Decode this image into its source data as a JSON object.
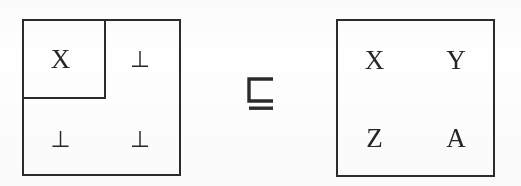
{
  "figure": {
    "kind": "matrix-refinement-diagram",
    "ink_color": "#2b2b2b",
    "background_color": "#fefefe"
  },
  "left_matrix": {
    "name": "partial-matrix",
    "rows": 2,
    "columns": 2,
    "cells": [
      [
        {
          "text": "X",
          "kind": "variable"
        },
        {
          "text": "⊥",
          "kind": "bottom"
        }
      ],
      [
        {
          "text": "⊥",
          "kind": "bottom"
        },
        {
          "text": "⊥",
          "kind": "bottom"
        }
      ]
    ],
    "inner_box": {
      "name": "defined-region",
      "contains": "X"
    }
  },
  "relation": {
    "symbol": "⊑",
    "name": "square-image-of-or-equal",
    "reading": "is refined by"
  },
  "right_matrix": {
    "name": "complete-matrix",
    "rows": 2,
    "columns": 2,
    "cells": [
      [
        {
          "text": "X",
          "kind": "variable"
        },
        {
          "text": "Y",
          "kind": "variable"
        }
      ],
      [
        {
          "text": "Z",
          "kind": "variable"
        },
        {
          "text": "A",
          "kind": "variable"
        }
      ]
    ]
  }
}
